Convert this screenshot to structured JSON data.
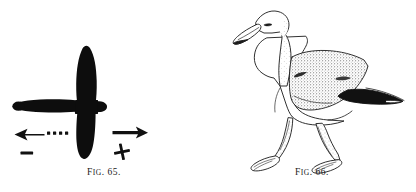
{
  "plate": {
    "background_color": "#ffffff",
    "ink_color": "#111111",
    "figures": [
      {
        "id": "fig-65",
        "caption_prefix": "F",
        "caption_prefix_small": "IG",
        "caption_number": ". 65.",
        "caption_full": "FIG. 65.",
        "subject": "bird-silhouette-from-above",
        "description_visible_marks": {
          "left_arrow": "←",
          "left_arrow_dots": "• • • •",
          "minus_sign": "−",
          "right_arrow": "→",
          "plus_sign": "+"
        }
      },
      {
        "id": "fig-66",
        "caption_prefix": "F",
        "caption_prefix_small": "IG",
        "caption_number": ". 66.",
        "caption_full": "FIG. 66.",
        "subject": "gull-walking-line-drawing"
      }
    ]
  },
  "fig65": {
    "caption_f": "F",
    "caption_ig": "IG",
    "caption_rest": ". 65.",
    "symbols": {
      "left_arrow_label": "←",
      "right_arrow_label": "→",
      "minus_label": "−",
      "plus_label": "+",
      "dot_count": 4
    }
  },
  "fig66": {
    "caption_f": "F",
    "caption_ig": "IG",
    "caption_rest": ". 66.",
    "parts": {
      "head": "gull-head",
      "bill": "gull-bill",
      "eye": "gull-eye",
      "neck": "gull-neck",
      "body": "gull-body",
      "wing": "gull-wing-stippled",
      "wingtip": "gull-wingtip-black",
      "tail": "gull-tail",
      "left_leg": "gull-left-leg",
      "right_leg": "gull-right-leg",
      "left_foot": "gull-left-webbed-foot",
      "right_foot": "gull-right-webbed-foot"
    }
  }
}
